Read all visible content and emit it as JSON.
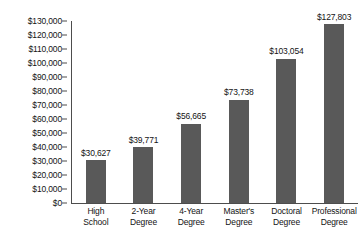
{
  "chart_data": {
    "type": "bar",
    "title": "",
    "subtitle": "",
    "xlabel": "",
    "ylabel": "",
    "ylim": [
      0,
      130000
    ],
    "ytick_step": 10000,
    "grid": false,
    "legend": false,
    "orientation": "vertical",
    "bar_color": "#595959",
    "axis_color": "#4d4d4d",
    "background_color": "#ffffff",
    "categories": [
      "High School",
      "2-Year Degree",
      "4-Year Degree",
      "Master's Degree",
      "Doctoral Degree",
      "Professional Degree"
    ],
    "category_lines": [
      [
        "High",
        "School"
      ],
      [
        "2-Year",
        "Degree"
      ],
      [
        "4-Year",
        "Degree"
      ],
      [
        "Master's",
        "Degree"
      ],
      [
        "Doctoral",
        "Degree"
      ],
      [
        "Professional",
        "Degree"
      ]
    ],
    "values": [
      30627,
      39771,
      56665,
      73738,
      103054,
      127803
    ],
    "value_labels": [
      "$30,627",
      "$39,771",
      "$56,665",
      "$73,738",
      "$103,054",
      "$127,803"
    ],
    "ytick_labels": [
      "$130,000",
      "$120,000",
      "$110,000",
      "$100,000",
      "$90,000",
      "$80,000",
      "$70,000",
      "$60,000",
      "$50,000",
      "$40,000",
      "$30,000",
      "$20,000",
      "$10,000",
      "$0"
    ],
    "ytick_values": [
      130000,
      120000,
      110000,
      100000,
      90000,
      80000,
      70000,
      60000,
      50000,
      40000,
      30000,
      20000,
      10000,
      0
    ]
  }
}
